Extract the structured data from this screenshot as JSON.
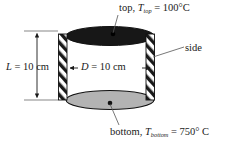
{
  "figure": {
    "background_color": "#ffffff",
    "ink_color": "#1a1a1a"
  },
  "geometry": {
    "top_disk_color": "#171717",
    "bottom_disk_color": "#b3b3b3",
    "side_wall_color": "#ffffff",
    "hatch_color": "#1a1a1a",
    "outline_color": "#000000"
  },
  "labels": {
    "top": {
      "prefix": "top, ",
      "symbol": "T",
      "subscript": "top",
      "value": " = 100°C"
    },
    "side": {
      "text": "side"
    },
    "bottom": {
      "prefix": "bottom, ",
      "symbol": "T",
      "subscript": "bottom",
      "value": " = 750° C"
    },
    "length": {
      "symbol": "L",
      "value": " = 10 cm"
    },
    "diameter": {
      "symbol": "D",
      "value": " = 10 cm"
    }
  },
  "dimensions": {
    "length_label": "L = 10 cm",
    "length_value": 10,
    "length_unit": "cm",
    "diameter_label": "D = 10 cm",
    "diameter_value": 10,
    "diameter_unit": "cm"
  },
  "temperatures": {
    "top_label": "T_top = 100°C",
    "top_value": 100,
    "bottom_label": "T_bottom = 750° C",
    "bottom_value": 750,
    "unit": "°C"
  }
}
